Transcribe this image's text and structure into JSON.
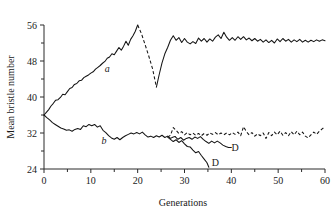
{
  "chart_data": {
    "type": "line",
    "title": "",
    "xlabel": "Generations",
    "ylabel": "Mean bristle number",
    "xlim": [
      0,
      60
    ],
    "ylim": [
      24,
      56
    ],
    "xticks": [
      0,
      10,
      20,
      30,
      40,
      50,
      60
    ],
    "xtick_labels": [
      "0",
      "10",
      "20",
      "30",
      "40",
      "50",
      "60"
    ],
    "xminor_ticks": [
      5,
      15,
      25,
      35,
      45,
      55
    ],
    "yticks": [
      24,
      32,
      40,
      48,
      56
    ],
    "ytick_labels": [
      "24",
      "32",
      "40",
      "48",
      "56"
    ],
    "yminor_ticks": [
      28,
      36,
      44,
      52
    ],
    "grid": false,
    "legend_position": "inline-annotations",
    "annotations": [
      {
        "text": "a",
        "x": 13.5,
        "y": 45.6,
        "style": "italic",
        "name": "series-a-label"
      },
      {
        "text": "b",
        "x": 12.8,
        "y": 29.6,
        "style": "italic",
        "name": "series-b-label"
      },
      {
        "text": "D",
        "x": 40.8,
        "y": 28.0,
        "style": "roman",
        "name": "discontinued-label-upper"
      },
      {
        "text": "D",
        "x": 36.6,
        "y": 24.6,
        "style": "roman",
        "name": "discontinued-label-lower"
      }
    ],
    "series": [
      {
        "name": "a-high-selection-solid-early",
        "label": "a",
        "linestyle": "solid",
        "x": [
          0,
          0.5,
          1,
          1.5,
          2,
          2.5,
          3,
          3.5,
          4,
          4.5,
          5,
          5.5,
          6,
          6.5,
          7,
          7.5,
          8,
          8.5,
          9,
          9.5,
          10,
          10.5,
          11,
          11.5,
          12,
          12.5,
          13,
          13.5,
          14,
          14.5,
          15,
          15.5,
          16,
          16.5,
          17,
          17.5,
          18,
          18.5,
          19,
          19.5,
          20
        ],
        "y": [
          36.0,
          36.6,
          37.2,
          38.0,
          38.6,
          39.3,
          39.4,
          39.9,
          40.6,
          40.5,
          41.2,
          41.9,
          42.1,
          42.8,
          43.0,
          43.6,
          43.7,
          44.3,
          44.6,
          44.9,
          45.3,
          45.6,
          46.2,
          46.6,
          47.0,
          47.5,
          47.9,
          48.6,
          48.9,
          49.6,
          49.4,
          50.2,
          51.0,
          50.4,
          51.3,
          52.4,
          51.5,
          52.8,
          53.6,
          54.6,
          56.0
        ]
      },
      {
        "name": "a-relaxed-dashed",
        "label": "a relaxed",
        "linestyle": "dashed",
        "x": [
          20,
          20.8,
          21.6,
          22.4,
          23.2,
          24
        ],
        "y": [
          56.0,
          54.1,
          51.6,
          49.0,
          46.2,
          42.2
        ]
      },
      {
        "name": "a-high-selection-solid-late",
        "label": "a",
        "linestyle": "solid",
        "x": [
          24,
          24.6,
          25.2,
          25.8,
          26.4,
          27,
          27.6,
          28.2,
          28.8,
          29.4,
          30,
          30.6,
          31.2,
          31.8,
          32.4,
          33,
          33.6,
          34.2,
          34.8,
          35.4,
          36,
          36.6,
          37.2,
          37.8,
          38.4,
          39,
          39.6,
          40.2,
          40.8,
          41.4,
          42,
          42.6,
          43.2,
          43.8,
          44.4,
          45,
          45.6,
          46.2,
          46.8,
          47.4,
          48,
          48.6,
          49.2,
          49.8,
          50.4,
          51,
          51.6,
          52.2,
          52.8,
          53.4,
          54,
          54.6,
          55.2,
          55.8,
          56.4,
          57,
          57.6,
          58.2,
          58.8,
          59.4,
          60
        ],
        "y": [
          42.2,
          45.0,
          47.6,
          49.6,
          51.0,
          52.6,
          53.6,
          52.6,
          53.2,
          52.1,
          53.0,
          52.2,
          51.8,
          52.3,
          51.9,
          53.1,
          52.4,
          53.0,
          52.2,
          52.9,
          52.4,
          53.3,
          53.8,
          53.0,
          54.4,
          53.3,
          52.6,
          53.2,
          52.6,
          53.4,
          52.8,
          53.4,
          52.7,
          53.1,
          52.5,
          53.0,
          52.4,
          52.8,
          52.2,
          52.7,
          52.1,
          52.6,
          52.0,
          52.9,
          52.3,
          53.0,
          52.4,
          52.8,
          52.2,
          52.7,
          52.3,
          52.8,
          52.2,
          52.6,
          52.2,
          52.6,
          52.3,
          52.7,
          52.4,
          52.7,
          52.5
        ]
      },
      {
        "name": "b-low-selection-solid-early",
        "label": "b",
        "linestyle": "solid",
        "x": [
          0,
          0.6,
          1.2,
          1.8,
          2.4,
          3,
          3.6,
          4.2,
          4.8,
          5.4,
          6,
          6.6,
          7.2,
          7.8,
          8.4,
          9,
          9.6,
          10.2,
          10.8,
          11.4,
          12,
          12.6,
          13.2,
          13.8,
          14.4,
          15,
          15.6,
          16.2,
          16.8,
          17.4,
          18,
          18.6,
          19.2,
          19.8,
          20.4,
          21,
          21.6,
          22.2,
          22.8,
          23.4,
          24,
          24.6,
          25.2,
          25.8,
          26.4,
          27,
          27.6,
          28
        ],
        "y": [
          36.0,
          35.4,
          34.9,
          34.3,
          33.9,
          33.5,
          33.1,
          32.9,
          32.6,
          32.7,
          32.4,
          32.8,
          33.0,
          32.8,
          33.6,
          33.4,
          33.9,
          33.6,
          33.9,
          33.3,
          33.6,
          32.6,
          32.1,
          31.4,
          30.9,
          30.6,
          31.0,
          30.5,
          31.0,
          31.4,
          31.7,
          32.0,
          31.8,
          32.1,
          31.8,
          32.2,
          31.6,
          31.1,
          31.3,
          31.0,
          31.4,
          31.1,
          31.5,
          31.0,
          31.3,
          30.8,
          31.1,
          31.2
        ]
      },
      {
        "name": "b-relaxed-dashed",
        "label": "b relaxed",
        "linestyle": "dashed",
        "x": [
          26.4,
          27,
          27.6,
          28.2,
          28.8,
          29.4,
          30,
          30.6,
          31.2,
          31.8,
          32.4,
          33,
          33.6,
          34.2,
          34.8,
          35.4,
          36,
          36.6,
          37.2,
          37.8,
          38.4,
          39,
          39.6,
          40.2,
          40.8,
          41.4,
          42,
          42.6,
          43.2,
          43.8,
          44.4,
          45,
          45.6,
          46.2,
          46.8,
          47.4,
          48,
          48.6,
          49.2,
          49.8,
          50.4,
          51,
          51.6,
          52.2,
          52.8,
          53.4,
          54,
          54.6,
          55.2,
          55.8,
          56.4,
          57,
          57.6,
          58.2,
          58.8,
          59.4,
          60
        ],
        "y": [
          31.1,
          31.5,
          33.2,
          32.6,
          31.9,
          32.3,
          31.6,
          32.1,
          31.6,
          32.0,
          31.5,
          31.9,
          31.4,
          31.9,
          31.5,
          32.0,
          31.7,
          32.1,
          31.6,
          32.0,
          31.6,
          32.0,
          31.6,
          32.1,
          31.7,
          32.2,
          31.4,
          33.4,
          32.3,
          31.6,
          32.1,
          31.3,
          31.8,
          31.4,
          32.0,
          30.8,
          32.1,
          31.4,
          32.2,
          31.6,
          32.4,
          31.5,
          32.1,
          31.4,
          32.3,
          31.6,
          32.4,
          31.6,
          32.2,
          31.3,
          30.9,
          31.6,
          32.2,
          31.7,
          32.4,
          32.9,
          33.4
        ]
      },
      {
        "name": "b-branch-discontinued-upper",
        "label": "D",
        "linestyle": "solid",
        "x": [
          28,
          28.6,
          29.2,
          29.8,
          30.4,
          31,
          31.6,
          32.2,
          32.8,
          33.4,
          34,
          34.6,
          35.2,
          35.8,
          36.4,
          37,
          37.6,
          38.2,
          38.8,
          39.4,
          40
        ],
        "y": [
          31.2,
          30.6,
          31.0,
          30.4,
          30.8,
          31.0,
          30.6,
          31.1,
          30.8,
          31.2,
          30.6,
          30.1,
          29.7,
          30.2,
          29.8,
          30.2,
          29.8,
          29.3,
          29.0,
          28.8,
          28.8
        ]
      },
      {
        "name": "b-branch-discontinued-lower",
        "label": "D",
        "linestyle": "solid",
        "x": [
          26.4,
          27,
          27.6,
          28.2,
          28.8,
          29.4,
          30,
          30.6,
          31.2,
          31.8,
          32.4,
          33,
          33.6,
          34.2,
          34.8,
          35.2
        ],
        "y": [
          31.1,
          30.6,
          30.1,
          30.5,
          29.9,
          30.3,
          29.6,
          29.0,
          28.9,
          28.2,
          27.6,
          27.9,
          27.0,
          26.2,
          25.4,
          24.4
        ]
      }
    ]
  },
  "axis": {
    "y_title": "Mean bristle number",
    "x_title": "Generations"
  }
}
